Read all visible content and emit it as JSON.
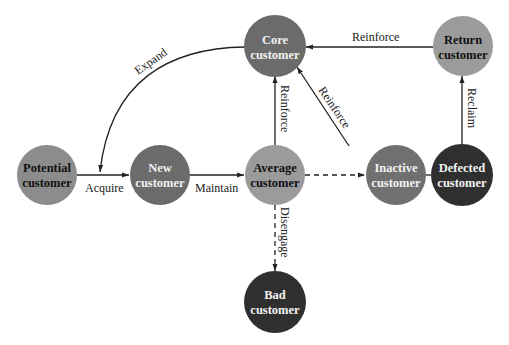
{
  "diagram": {
    "type": "customer-lifecycle-flow",
    "nodes": [
      {
        "id": "potential",
        "line1": "Potential",
        "line2": "customer",
        "cx": 47,
        "cy": 175,
        "fill": "#8c8c8c",
        "text": "#111111"
      },
      {
        "id": "new",
        "line1": "New",
        "line2": "customer",
        "cx": 160,
        "cy": 175,
        "fill": "#6b6b6b",
        "text": "#f2f2f2"
      },
      {
        "id": "average",
        "line1": "Average",
        "line2": "customer",
        "cx": 275,
        "cy": 175,
        "fill": "#9b9b9b",
        "text": "#111111"
      },
      {
        "id": "inactive",
        "line1": "Inactive",
        "line2": "customer",
        "cx": 396,
        "cy": 175,
        "fill": "#707070",
        "text": "#f2f2f2"
      },
      {
        "id": "defected",
        "line1": "Defected",
        "line2": "customer",
        "cx": 462,
        "cy": 175,
        "fill": "#2f2f2f",
        "text": "#f2f2f2"
      },
      {
        "id": "core",
        "line1": "Core",
        "line2": "customer",
        "cx": 275,
        "cy": 45,
        "fill": "#6b6b6b",
        "text": "#f2f2f2"
      },
      {
        "id": "return",
        "line1": "Return",
        "line2": "customer",
        "cx": 463,
        "cy": 45,
        "fill": "#9b9b9b",
        "text": "#111111"
      },
      {
        "id": "bad",
        "line1": "Bad",
        "line2": "customer",
        "cx": 275,
        "cy": 302,
        "fill": "#2f2f2f",
        "text": "#f2f2f2"
      }
    ],
    "edges": [
      {
        "from": "potential",
        "to": "new",
        "label": "Acquire",
        "style": "solid"
      },
      {
        "from": "new",
        "to": "average",
        "label": "Maintain",
        "style": "solid"
      },
      {
        "from": "average",
        "to": "inactive",
        "label": "",
        "style": "dashed"
      },
      {
        "from": "inactive",
        "to": "defected",
        "label": "",
        "style": "dashed"
      },
      {
        "from": "average",
        "to": "core",
        "label": "Reinforce",
        "style": "solid"
      },
      {
        "from": "inactive",
        "to": "core",
        "label": "Reinforce",
        "style": "solid"
      },
      {
        "from": "return",
        "to": "core",
        "label": "Reinforce",
        "style": "solid"
      },
      {
        "from": "defected",
        "to": "return",
        "label": "Reclaim",
        "style": "solid"
      },
      {
        "from": "average",
        "to": "bad",
        "label": "Disengage",
        "style": "dashed"
      },
      {
        "from": "core",
        "to": "new",
        "label": "Expand",
        "style": "solid-curve"
      }
    ]
  },
  "labels": {
    "acquire": "Acquire",
    "maintain": "Maintain",
    "reinforce_top": "Reinforce",
    "reinforce_vertical": "Reinforce",
    "reinforce_diagonal": "Reinforce",
    "reclaim": "Reclaim",
    "disengage": "Disengage",
    "expand": "Expand"
  },
  "nodes_text": {
    "potential": {
      "l1": "Potential",
      "l2": "customer"
    },
    "new": {
      "l1": "New",
      "l2": "customer"
    },
    "average": {
      "l1": "Average",
      "l2": "customer"
    },
    "inactive": {
      "l1": "Inactive",
      "l2": "customer"
    },
    "defected": {
      "l1": "Defected",
      "l2": "customer"
    },
    "core": {
      "l1": "Core",
      "l2": "customer"
    },
    "return": {
      "l1": "Return",
      "l2": "customer"
    },
    "bad": {
      "l1": "Bad",
      "l2": "customer"
    }
  }
}
